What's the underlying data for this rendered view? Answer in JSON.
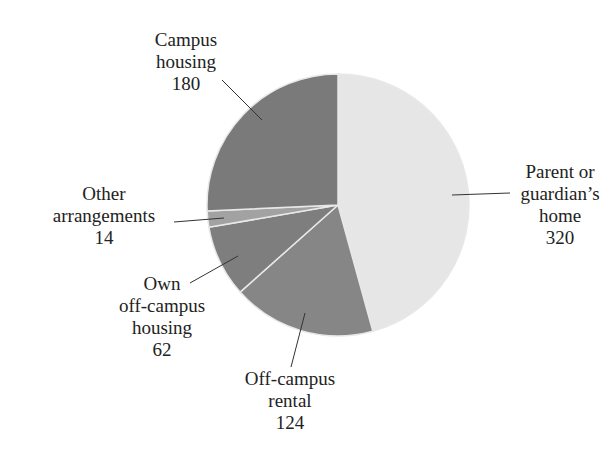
{
  "chart_data": {
    "type": "pie",
    "title": "",
    "total": 700,
    "start_angle_deg": 0,
    "direction": "clockwise",
    "center": [
      338,
      205
    ],
    "radius": 131,
    "slices": [
      {
        "label": "Parent or guardian’s home",
        "value": 320,
        "color": "#e6e6e6",
        "label_lines": [
          "Parent or",
          "guardian’s",
          "home",
          "320"
        ],
        "label_pos": [
          560,
          178
        ],
        "leader": [
          [
            452,
            195
          ],
          [
            510,
            193
          ]
        ]
      },
      {
        "label": "Off-campus rental",
        "value": 124,
        "color": "#868686",
        "label_lines": [
          "Off-campus",
          "rental",
          "124"
        ],
        "label_pos": [
          290,
          385
        ],
        "leader": [
          [
            305,
            313
          ],
          [
            291,
            367
          ]
        ]
      },
      {
        "label": "Own off-campus housing",
        "value": 62,
        "color": "#7e7e7e",
        "label_lines": [
          "Own",
          "off-campus",
          "housing",
          "62"
        ],
        "label_pos": [
          162,
          290
        ],
        "leader": [
          [
            238,
            256
          ],
          [
            190,
            283
          ]
        ]
      },
      {
        "label": "Other arrangements",
        "value": 14,
        "color": "#a2a2a2",
        "label_lines": [
          "Other",
          "arrangements",
          "14"
        ],
        "label_pos": [
          104,
          200
        ],
        "leader": [
          [
            224,
            218
          ],
          [
            174,
            222
          ]
        ]
      },
      {
        "label": "Campus housing",
        "value": 180,
        "color": "#7a7a7a",
        "label_lines": [
          "Campus",
          "housing",
          "180"
        ],
        "label_pos": [
          186,
          46
        ],
        "leader": [
          [
            262,
            120
          ],
          [
            222,
            80
          ]
        ]
      }
    ]
  }
}
